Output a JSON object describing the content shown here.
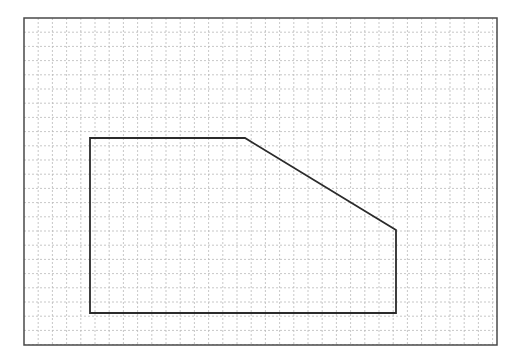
{
  "page": {
    "background_color": "#ffffff",
    "width": 523,
    "height": 359
  },
  "chart_data": {
    "type": "scatter",
    "title": "",
    "subtitle": "",
    "xlabel": "",
    "ylabel": "",
    "legend": [],
    "annotations": [],
    "grid": {
      "visible": true,
      "style": "dashed",
      "color": "#b9b9b9",
      "line_width": 0.8,
      "dash_pattern": "2 2",
      "cell_size_px": 14.2,
      "columns": 33,
      "rows": 23,
      "origin_x": 24,
      "origin_y": 18
    },
    "frame": {
      "visible": true,
      "color": "#4a4a4a",
      "line_width": 1.5,
      "x": 24,
      "y": 18,
      "width": 473,
      "height": 327
    },
    "shapes": [
      {
        "name": "clipped-rectangle-polygon",
        "type": "polygon",
        "closed": true,
        "stroke_color": "#2b2b2b",
        "stroke_width": 1.8,
        "fill": "none",
        "vertices": [
          {
            "label": "top-left",
            "x": 90,
            "y": 138
          },
          {
            "label": "top-bend",
            "x": 245,
            "y": 138
          },
          {
            "label": "diagonal-end",
            "x": 396,
            "y": 230
          },
          {
            "label": "bottom-right",
            "x": 396,
            "y": 313
          },
          {
            "label": "bottom-left",
            "x": 90,
            "y": 313
          }
        ],
        "edges": [
          {
            "label": "top-edge",
            "from": "top-left",
            "to": "top-bend",
            "orientation": "horizontal"
          },
          {
            "label": "diagonal-edge",
            "from": "top-bend",
            "to": "diagonal-end",
            "orientation": "diagonal"
          },
          {
            "label": "right-edge",
            "from": "diagonal-end",
            "to": "bottom-right",
            "orientation": "vertical"
          },
          {
            "label": "bottom-edge",
            "from": "bottom-right",
            "to": "bottom-left",
            "orientation": "horizontal"
          },
          {
            "label": "left-edge",
            "from": "bottom-left",
            "to": "top-left",
            "orientation": "vertical"
          }
        ]
      }
    ],
    "axis_ticks": {
      "x": [],
      "y": []
    },
    "xlim": [
      24,
      497
    ],
    "ylim": [
      18,
      345
    ]
  }
}
